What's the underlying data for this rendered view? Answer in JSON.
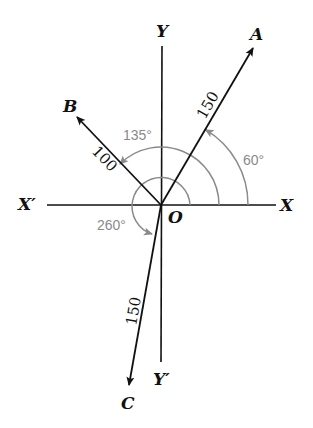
{
  "diagram": {
    "axes": {
      "x_pos": "X",
      "x_neg": "X′",
      "y_pos": "Y",
      "y_neg": "Y′",
      "origin": "O"
    },
    "vectors": [
      {
        "name": "A",
        "magnitude": "150",
        "angle": "60°"
      },
      {
        "name": "B",
        "magnitude": "100",
        "angle": "135°"
      },
      {
        "name": "C",
        "magnitude": "150",
        "angle": "260°"
      }
    ],
    "colors": {
      "ink": "#111111",
      "angle_arc": "#8a8a8a",
      "background": "#ffffff"
    }
  }
}
